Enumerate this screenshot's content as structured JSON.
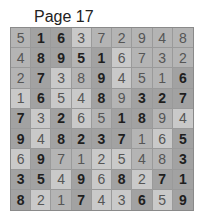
{
  "header": {
    "title": "Page 17"
  },
  "puzzle": {
    "rows": [
      [
        {
          "v": "5",
          "g": false,
          "s": "mid"
        },
        {
          "v": "1",
          "g": true,
          "s": "dark"
        },
        {
          "v": "6",
          "g": true,
          "s": "dark"
        },
        {
          "v": "3",
          "g": false,
          "s": "light"
        },
        {
          "v": "7",
          "g": false,
          "s": "mid"
        },
        {
          "v": "2",
          "g": false,
          "s": "mid"
        },
        {
          "v": "9",
          "g": false,
          "s": "mid"
        },
        {
          "v": "4",
          "g": false,
          "s": "mid"
        },
        {
          "v": "8",
          "g": false,
          "s": "mid"
        }
      ],
      [
        {
          "v": "4",
          "g": false,
          "s": "mid"
        },
        {
          "v": "8",
          "g": true,
          "s": "dark"
        },
        {
          "v": "9",
          "g": true,
          "s": "dark"
        },
        {
          "v": "5",
          "g": true,
          "s": "mid"
        },
        {
          "v": "1",
          "g": true,
          "s": "dark"
        },
        {
          "v": "6",
          "g": false,
          "s": "light"
        },
        {
          "v": "7",
          "g": false,
          "s": "mid"
        },
        {
          "v": "3",
          "g": false,
          "s": "mid"
        },
        {
          "v": "2",
          "g": false,
          "s": "mid"
        }
      ],
      [
        {
          "v": "2",
          "g": false,
          "s": "mid"
        },
        {
          "v": "7",
          "g": true,
          "s": "dark"
        },
        {
          "v": "3",
          "g": false,
          "s": "light"
        },
        {
          "v": "8",
          "g": false,
          "s": "mid"
        },
        {
          "v": "9",
          "g": true,
          "s": "dark"
        },
        {
          "v": "4",
          "g": false,
          "s": "light"
        },
        {
          "v": "5",
          "g": false,
          "s": "mid"
        },
        {
          "v": "1",
          "g": false,
          "s": "mid"
        },
        {
          "v": "6",
          "g": true,
          "s": "dark"
        }
      ],
      [
        {
          "v": "1",
          "g": false,
          "s": "light"
        },
        {
          "v": "6",
          "g": true,
          "s": "dark"
        },
        {
          "v": "5",
          "g": false,
          "s": "light"
        },
        {
          "v": "4",
          "g": false,
          "s": "light"
        },
        {
          "v": "8",
          "g": true,
          "s": "dark"
        },
        {
          "v": "9",
          "g": false,
          "s": "mid"
        },
        {
          "v": "3",
          "g": true,
          "s": "dark"
        },
        {
          "v": "2",
          "g": true,
          "s": "dark"
        },
        {
          "v": "7",
          "g": true,
          "s": "dark"
        }
      ],
      [
        {
          "v": "7",
          "g": true,
          "s": "dark"
        },
        {
          "v": "3",
          "g": false,
          "s": "light"
        },
        {
          "v": "2",
          "g": true,
          "s": "dark"
        },
        {
          "v": "6",
          "g": false,
          "s": "light"
        },
        {
          "v": "5",
          "g": false,
          "s": "mid"
        },
        {
          "v": "1",
          "g": true,
          "s": "dark"
        },
        {
          "v": "8",
          "g": true,
          "s": "dark"
        },
        {
          "v": "9",
          "g": false,
          "s": "mid"
        },
        {
          "v": "4",
          "g": false,
          "s": "light"
        }
      ],
      [
        {
          "v": "9",
          "g": true,
          "s": "dark"
        },
        {
          "v": "4",
          "g": false,
          "s": "light"
        },
        {
          "v": "8",
          "g": true,
          "s": "dark"
        },
        {
          "v": "2",
          "g": true,
          "s": "dark"
        },
        {
          "v": "3",
          "g": true,
          "s": "dark"
        },
        {
          "v": "7",
          "g": true,
          "s": "dark"
        },
        {
          "v": "1",
          "g": false,
          "s": "mid"
        },
        {
          "v": "6",
          "g": false,
          "s": "light"
        },
        {
          "v": "5",
          "g": true,
          "s": "dark"
        }
      ],
      [
        {
          "v": "6",
          "g": false,
          "s": "light"
        },
        {
          "v": "9",
          "g": true,
          "s": "dark"
        },
        {
          "v": "7",
          "g": false,
          "s": "mid"
        },
        {
          "v": "1",
          "g": false,
          "s": "mid"
        },
        {
          "v": "2",
          "g": false,
          "s": "light"
        },
        {
          "v": "5",
          "g": false,
          "s": "light"
        },
        {
          "v": "4",
          "g": false,
          "s": "mid"
        },
        {
          "v": "8",
          "g": false,
          "s": "mid"
        },
        {
          "v": "3",
          "g": true,
          "s": "dark"
        }
      ],
      [
        {
          "v": "3",
          "g": true,
          "s": "dark"
        },
        {
          "v": "5",
          "g": true,
          "s": "dark"
        },
        {
          "v": "4",
          "g": false,
          "s": "light"
        },
        {
          "v": "9",
          "g": true,
          "s": "dark"
        },
        {
          "v": "6",
          "g": false,
          "s": "light"
        },
        {
          "v": "8",
          "g": true,
          "s": "dark"
        },
        {
          "v": "2",
          "g": false,
          "s": "light"
        },
        {
          "v": "7",
          "g": true,
          "s": "dark"
        },
        {
          "v": "1",
          "g": true,
          "s": "dark"
        }
      ],
      [
        {
          "v": "8",
          "g": true,
          "s": "dark"
        },
        {
          "v": "2",
          "g": false,
          "s": "light"
        },
        {
          "v": "1",
          "g": false,
          "s": "mid"
        },
        {
          "v": "7",
          "g": true,
          "s": "dark"
        },
        {
          "v": "4",
          "g": false,
          "s": "light"
        },
        {
          "v": "3",
          "g": false,
          "s": "light"
        },
        {
          "v": "6",
          "g": true,
          "s": "dark"
        },
        {
          "v": "5",
          "g": false,
          "s": "light"
        },
        {
          "v": "9",
          "g": true,
          "s": "dark"
        }
      ]
    ]
  }
}
